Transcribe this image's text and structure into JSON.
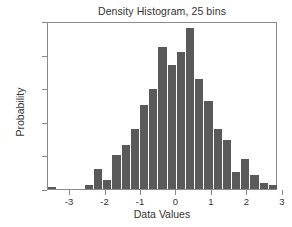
{
  "chart_data": {
    "type": "bar",
    "title": "Density Histogram, 25 bins",
    "xlabel": "Data Values",
    "ylabel": "Probability",
    "xlim": [
      -3.62,
      2.86
    ],
    "ylim": [
      0.0,
      0.5
    ],
    "grid": false,
    "legend": null,
    "bin_count": 25,
    "bin_width": 0.2592,
    "bin_edges": [
      -3.62,
      -3.3608,
      -3.1016,
      -2.8424,
      -2.5832,
      -2.324,
      -2.0648,
      -1.8056,
      -1.5464,
      -1.2872,
      -1.028,
      -0.7688,
      -0.5096,
      -0.2504,
      0.0088,
      0.268,
      0.5272,
      0.7864,
      1.0456,
      1.3048,
      1.564,
      1.8232,
      2.0824,
      2.3416,
      2.6008,
      2.86
    ],
    "bin_centers": [
      -3.49,
      -3.23,
      -2.97,
      -2.71,
      -2.45,
      -2.19,
      -1.94,
      -1.68,
      -1.42,
      -1.16,
      -0.9,
      -0.64,
      -0.38,
      -0.12,
      0.14,
      0.4,
      0.66,
      0.92,
      1.18,
      1.43,
      1.69,
      1.95,
      2.21,
      2.47,
      2.73
    ],
    "categories": [
      "-3.49",
      "-3.23",
      "-2.97",
      "-2.71",
      "-2.45",
      "-2.19",
      "-1.94",
      "-1.68",
      "-1.42",
      "-1.16",
      "-0.90",
      "-0.64",
      "-0.38",
      "-0.12",
      "0.14",
      "0.40",
      "0.66",
      "0.92",
      "1.18",
      "1.43",
      "1.69",
      "1.95",
      "2.21",
      "2.47",
      "2.73"
    ],
    "values": [
      0.005,
      0.0,
      0.0,
      0.0,
      0.013,
      0.06,
      0.028,
      0.1,
      0.13,
      0.178,
      0.249,
      0.297,
      0.424,
      0.368,
      0.408,
      0.478,
      0.328,
      0.262,
      0.178,
      0.145,
      0.052,
      0.09,
      0.043,
      0.019,
      0.011
    ],
    "xticks": [
      -3,
      -2,
      -1,
      0,
      1,
      2,
      3
    ],
    "xtick_labels": [
      "-3",
      "-2",
      "-1",
      "0",
      "1",
      "2",
      "3"
    ],
    "yticks": [
      0.0,
      0.1,
      0.2,
      0.3,
      0.4,
      0.5
    ],
    "ytick_labels": [
      "0.0",
      "0.1",
      "0.2",
      "0.3",
      "0.4",
      "0.5"
    ],
    "bar_color": "#5a5a5a",
    "axis_color": "#8a8a8a",
    "background_color": "#ffffff"
  }
}
